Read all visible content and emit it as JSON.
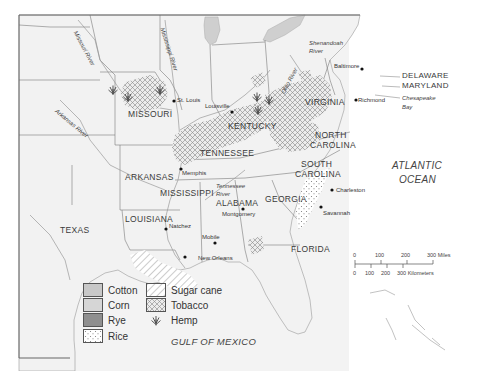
{
  "map": {
    "type": "historical crop distribution map",
    "region": "Southern United States",
    "states": [
      {
        "name": "MISSOURI"
      },
      {
        "name": "KENTUCKY"
      },
      {
        "name": "VIRGINIA"
      },
      {
        "name": "TENNESSEE"
      },
      {
        "name": "NORTH CAROLINA"
      },
      {
        "name": "SOUTH CAROLINA"
      },
      {
        "name": "ARKANSAS"
      },
      {
        "name": "MISSISSIPPI"
      },
      {
        "name": "ALABAMA"
      },
      {
        "name": "GEORGIA"
      },
      {
        "name": "LOUISIANA"
      },
      {
        "name": "TEXAS"
      },
      {
        "name": "FLORIDA"
      },
      {
        "name": "DELAWARE"
      },
      {
        "name": "MARYLAND"
      }
    ],
    "labels": {
      "missouri": "MISSOURI",
      "kentucky": "KENTUCKY",
      "virginia": "VIRGINIA",
      "tennessee": "TENNESSEE",
      "north_carolina_1": "NORTH",
      "north_carolina_2": "CAROLINA",
      "south_carolina_1": "SOUTH",
      "south_carolina_2": "CAROLINA",
      "arkansas": "ARKANSAS",
      "mississippi": "MISSISSIPPI",
      "alabama": "ALABAMA",
      "georgia": "GEORGIA",
      "louisiana": "LOUISIANA",
      "texas": "TEXAS",
      "florida": "FLORIDA",
      "delaware": "DELAWARE",
      "maryland": "MARYLAND"
    },
    "cities": {
      "st_louis": "St. Louis",
      "louisville": "Louisville",
      "baltimore": "Baltimore",
      "richmond": "Richmond",
      "memphis": "Memphis",
      "charleston": "Charleston",
      "savannah": "Savannah",
      "montgomery": "Montgomery",
      "natchez": "Natchez",
      "mobile": "Mobile",
      "new_orleans": "New Orleans"
    },
    "rivers": {
      "missouri": "Missouri River",
      "mississippi": "Mississippi River",
      "arkansas": "Arkansas River",
      "ohio": "Ohio River",
      "shenandoah_1": "Shenandoah",
      "shenandoah_2": "River",
      "tennessee_1": "Tennessee",
      "tennessee_2": "River"
    },
    "water": {
      "chesapeake_1": "Chesapeake",
      "chesapeake_2": "Bay",
      "atlantic_1": "ATLANTIC",
      "atlantic_2": "OCEAN",
      "gulf": "GULF OF MEXICO"
    }
  },
  "legend": {
    "items": [
      {
        "label": "Cotton",
        "pattern": "solid-light-gray",
        "color": "#c8c8c8"
      },
      {
        "label": "Corn",
        "pattern": "solid-lighter-gray",
        "color": "#d4d4d4"
      },
      {
        "label": "Rye",
        "pattern": "solid-dark-gray",
        "color": "#8f8f8f"
      },
      {
        "label": "Rice",
        "pattern": "dotted",
        "color": "#f4f4f4"
      },
      {
        "label": "Sugar cane",
        "pattern": "diagonal-hatch",
        "color": "#ffffff"
      },
      {
        "label": "Tobacco",
        "pattern": "crosshatch",
        "color": "#ffffff"
      },
      {
        "label": "Hemp",
        "pattern": "hemp-plant-icon",
        "color": "#555555"
      }
    ]
  },
  "scale": {
    "miles_ticks": [
      "0",
      "100",
      "200",
      "300 Miles"
    ],
    "km_ticks": [
      "0",
      "100",
      "200",
      "300 Kilometers"
    ]
  }
}
